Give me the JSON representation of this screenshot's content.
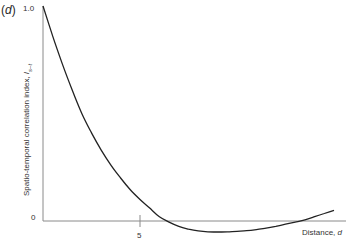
{
  "panel": {
    "label": "d"
  },
  "chart_data": {
    "type": "line",
    "title": "",
    "xlabel": "Distance, d",
    "ylabel": "Spatio-temporal correlation index, I_s-t",
    "ylabel_main": "Spatio-temporal correlation index, ",
    "ylabel_symbol": "I",
    "ylabel_subscript": "s–t",
    "xlabel_main": "Distance, ",
    "xlabel_symbol": "d",
    "x_ticks": [
      5
    ],
    "x_tick_labels": [
      "5"
    ],
    "y_ticks": [
      0,
      1.0
    ],
    "y_tick_labels": [
      "0",
      "1.0"
    ],
    "xlim": [
      0,
      15.3
    ],
    "ylim": [
      -0.06,
      1.0
    ],
    "grid": false,
    "legend": null,
    "series": [
      {
        "name": "Spatio-temporal correlation index",
        "x": [
          0,
          0.5,
          1,
          1.5,
          2,
          2.5,
          3,
          3.5,
          4,
          4.5,
          5,
          5.5,
          6,
          6.5,
          7,
          7.5,
          8,
          8.5,
          9,
          9.5,
          10,
          10.5,
          11,
          11.5,
          12,
          12.5,
          13,
          13.5,
          14,
          14.5,
          15
        ],
        "y": [
          1.0,
          0.86,
          0.73,
          0.61,
          0.5,
          0.41,
          0.33,
          0.26,
          0.2,
          0.145,
          0.1,
          0.06,
          0.02,
          -0.005,
          -0.025,
          -0.038,
          -0.046,
          -0.05,
          -0.051,
          -0.05,
          -0.048,
          -0.045,
          -0.04,
          -0.033,
          -0.025,
          -0.015,
          -0.005,
          0.005,
          0.02,
          0.035,
          0.05
        ]
      }
    ]
  },
  "colors": {
    "curve": "#222222",
    "axis": "#8a8a8a",
    "text": "#333333"
  }
}
